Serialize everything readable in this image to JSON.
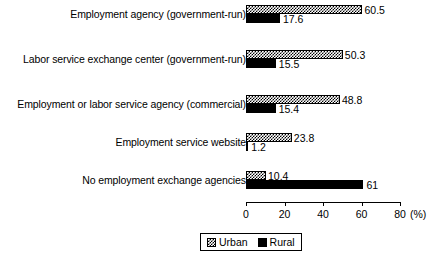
{
  "chart_data": {
    "type": "bar",
    "orientation": "horizontal",
    "title": "",
    "xlabel": "(%)",
    "ylabel": "",
    "xlim": [
      0,
      80
    ],
    "xticks": [
      0,
      20,
      40,
      60,
      80
    ],
    "xtick_labels": [
      "0",
      "20",
      "40",
      "60",
      "80"
    ],
    "grid": false,
    "legend_position": "bottom",
    "unit_label": "(%)",
    "categories": [
      "Employment agency (government-run)",
      "Labor service exchange center (government-run)",
      "Employment or labor service agency (commercial)",
      "Employment service website",
      "No employment exchange agencies"
    ],
    "series": [
      {
        "name": "Urban",
        "pattern": "checkerboard",
        "values": [
          60.5,
          50.3,
          48.8,
          23.8,
          10.4
        ],
        "value_labels": [
          "60.5",
          "50.3",
          "48.8",
          "23.8",
          "10.4"
        ]
      },
      {
        "name": "Rural",
        "pattern": "solid-black",
        "values": [
          17.6,
          15.5,
          15.4,
          1.2,
          61
        ],
        "value_labels": [
          "17.6",
          "15.5",
          "15.4",
          "1.2",
          "61"
        ]
      }
    ]
  },
  "legend": {
    "items": [
      {
        "label": "Urban",
        "swatch": "checkerboard-swatch"
      },
      {
        "label": "Rural",
        "swatch": "solid-black-swatch"
      }
    ]
  },
  "colors": {
    "ink": "#000000",
    "background": "#ffffff"
  }
}
